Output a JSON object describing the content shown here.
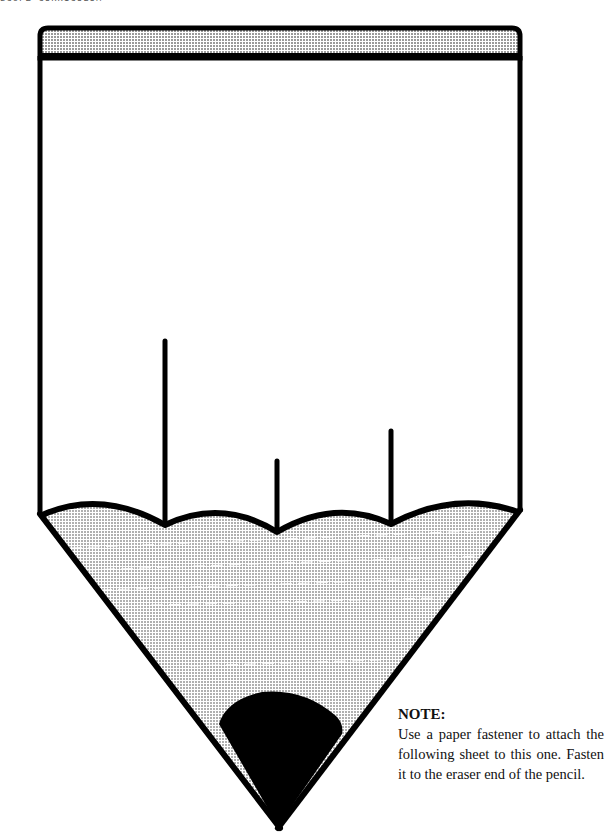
{
  "page": {
    "header_fragment": "SCOPE CURRICULUM"
  },
  "pencil": {
    "eraser_band_fill": "#cfcfcf",
    "outline_color": "#000000",
    "sharpened_wood_fill": "#d6d6d6",
    "lead_color": "#000000",
    "body_fill": "#ffffff"
  },
  "note": {
    "title": "NOTE:",
    "body": "Use a paper fastener to attach the following sheet to this one. Fasten it to the eraser end of the pencil."
  }
}
